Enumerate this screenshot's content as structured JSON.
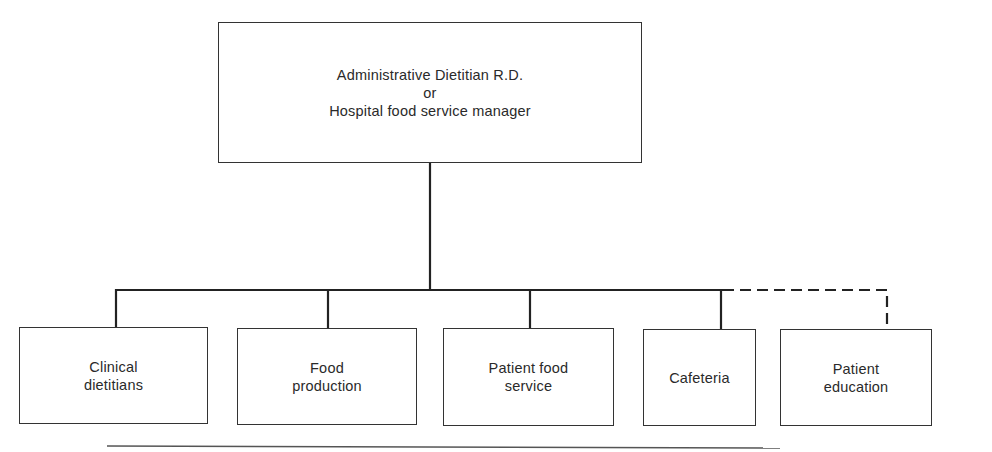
{
  "diagram": {
    "type": "org-chart",
    "root": {
      "label": "Administrative Dietitian R.D.\nor\nHospital food service manager"
    },
    "children": [
      {
        "label": "Clinical\ndietitians",
        "link": "solid"
      },
      {
        "label": "Food\nproduction",
        "link": "solid"
      },
      {
        "label": "Patient food\nservice",
        "link": "solid"
      },
      {
        "label": "Cafeteria",
        "link": "solid"
      },
      {
        "label": "Patient\neducation",
        "link": "dashed"
      }
    ]
  }
}
